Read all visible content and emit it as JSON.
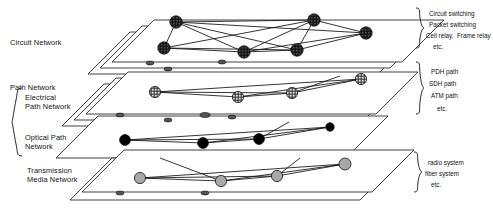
{
  "figure": {
    "type": "layered-network-stack",
    "background": "#ffffff",
    "ink": "#111111"
  },
  "layers": [
    {
      "id": "circuit",
      "name": "Circuit Network",
      "node_style": "dark-crosshatch",
      "node_fill": "#3a3a3a",
      "node_count": 6,
      "nodes": [
        {
          "x": 176,
          "y": 22
        },
        {
          "x": 314,
          "y": 20
        },
        {
          "x": 366,
          "y": 33
        },
        {
          "x": 164,
          "y": 48
        },
        {
          "x": 244,
          "y": 52
        },
        {
          "x": 297,
          "y": 50
        }
      ],
      "edges": [
        [
          0,
          1
        ],
        [
          0,
          2
        ],
        [
          0,
          3
        ],
        [
          0,
          4
        ],
        [
          0,
          5
        ],
        [
          1,
          2
        ],
        [
          1,
          3
        ],
        [
          1,
          4
        ],
        [
          1,
          5
        ],
        [
          2,
          4
        ],
        [
          2,
          5
        ],
        [
          3,
          4
        ],
        [
          3,
          5
        ],
        [
          4,
          5
        ]
      ],
      "plane": {
        "x": 118,
        "y": 6,
        "w": 290,
        "h": 58,
        "skew": 42
      }
    },
    {
      "id": "electrical-path",
      "name": "Electrical Path Network",
      "node_style": "light-crosshatch",
      "node_fill": "#d8d8d8",
      "node_count": 4,
      "nodes": [
        {
          "x": 155,
          "y": 92
        },
        {
          "x": 238,
          "y": 97
        },
        {
          "x": 292,
          "y": 93
        },
        {
          "x": 361,
          "y": 79
        }
      ],
      "edges": [
        [
          0,
          1
        ],
        [
          0,
          2
        ],
        [
          0,
          3
        ],
        [
          1,
          2
        ],
        [
          1,
          3
        ],
        [
          2,
          3
        ]
      ],
      "plane": {
        "x": 100,
        "y": 62,
        "w": 290,
        "h": 46,
        "skew": 42
      }
    },
    {
      "id": "optical-path",
      "name": "Optical Path Network",
      "node_style": "solid-black",
      "node_fill": "#000000",
      "node_count": 4,
      "nodes": [
        {
          "x": 125,
          "y": 140
        },
        {
          "x": 203,
          "y": 143
        },
        {
          "x": 259,
          "y": 139
        },
        {
          "x": 330,
          "y": 127
        }
      ],
      "edges": [
        [
          0,
          1
        ],
        [
          0,
          2
        ],
        [
          0,
          3
        ],
        [
          1,
          3
        ],
        [
          2,
          3
        ],
        [
          1,
          2
        ]
      ],
      "plane": {
        "x": 78,
        "y": 112,
        "w": 290,
        "h": 40,
        "skew": 42
      }
    },
    {
      "id": "transmission-media",
      "name": "Transmission Media Network",
      "node_style": "gray-fill",
      "node_fill": "#a8a8a8",
      "node_count": 4,
      "nodes": [
        {
          "x": 140,
          "y": 178
        },
        {
          "x": 221,
          "y": 181
        },
        {
          "x": 277,
          "y": 176
        },
        {
          "x": 345,
          "y": 164
        }
      ],
      "edges": [
        [
          0,
          1
        ],
        [
          0,
          2
        ],
        [
          0,
          3
        ],
        [
          1,
          3
        ],
        [
          2,
          3
        ],
        [
          1,
          2
        ]
      ],
      "plane": {
        "x": 92,
        "y": 150,
        "w": 290,
        "h": 42,
        "skew": 42
      }
    }
  ],
  "left_labels": {
    "circuit": "Circuit Network",
    "path_group": "Path Network",
    "electrical": "Electrical\nPath Network",
    "optical": "Optical Path\nNetwork",
    "transmission": "Transmission\nMedia Network"
  },
  "right_groups": [
    {
      "id": "circuit-technologies",
      "items": [
        "Circuit switching",
        "Packet switching",
        "Cell relay,  Frame relay",
        "etc."
      ]
    },
    {
      "id": "path-technologies",
      "items": [
        "PDH path",
        "SDH path",
        "ATM path",
        "etc."
      ]
    },
    {
      "id": "media-technologies",
      "items": [
        "radio system",
        "fiber system",
        "etc."
      ]
    }
  ]
}
